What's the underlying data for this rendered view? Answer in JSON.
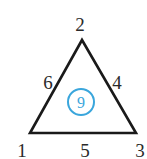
{
  "diagram": {
    "type": "number-triangle",
    "vertices": {
      "top": "2",
      "bottom_left": "1",
      "bottom_right": "3"
    },
    "sides": {
      "left": "6",
      "right": "4",
      "bottom": "5"
    },
    "center": "9",
    "colors": {
      "triangle_stroke": "#1a1a1a",
      "text": "#2a2a2a",
      "circle": "#3aa6dc"
    }
  }
}
